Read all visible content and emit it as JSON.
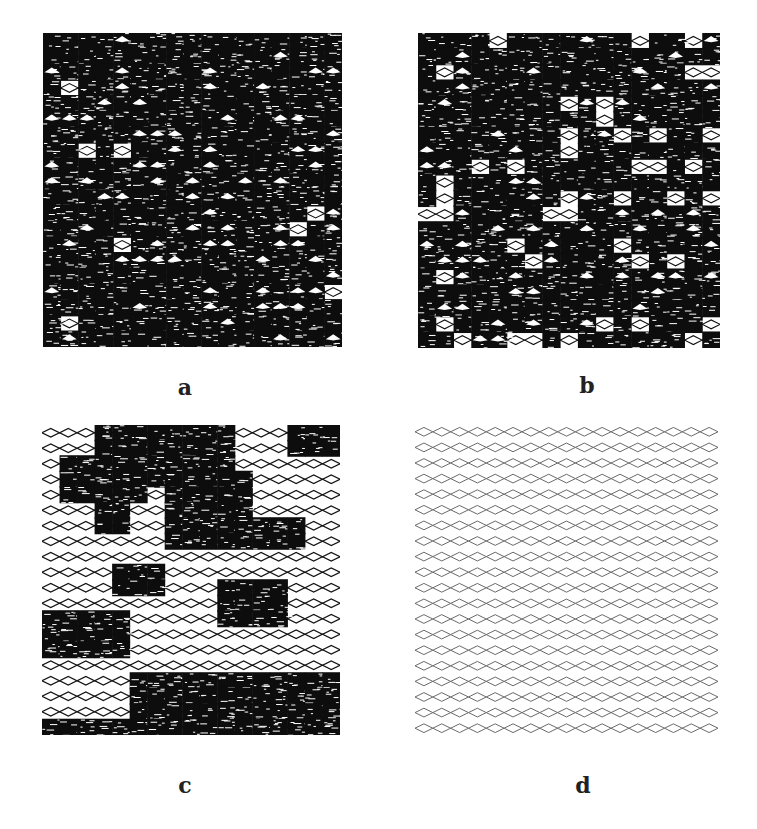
{
  "figure": {
    "panels": [
      {
        "id": "a",
        "label": "a",
        "x": 43,
        "y": 33,
        "width": 299,
        "height": 314,
        "label_x": 165,
        "label_y": 376,
        "rows": 20,
        "cols": 17,
        "density": 0.97,
        "line_color": "#111111",
        "line_width": 1.1,
        "blobs": []
      },
      {
        "id": "b",
        "label": "b",
        "x": 418,
        "y": 33,
        "width": 302,
        "height": 315,
        "label_x": 567,
        "label_y": 374,
        "rows": 20,
        "cols": 17,
        "density": 0.88,
        "line_color": "#111111",
        "line_width": 1.1,
        "blobs": []
      },
      {
        "id": "c",
        "label": "c",
        "x": 42,
        "y": 425,
        "width": 298,
        "height": 310,
        "label_x": 165,
        "label_y": 774,
        "rows": 20,
        "cols": 17,
        "density": 0.0,
        "line_color": "#151515",
        "line_width": 1.3,
        "blobs": [
          {
            "r0": 0,
            "r1": 3,
            "c0": 3,
            "c1": 7
          },
          {
            "r0": 0,
            "r1": 2,
            "c0": 8,
            "c1": 10
          },
          {
            "r0": 0,
            "r1": 1,
            "c0": 14,
            "c1": 16
          },
          {
            "r0": 2,
            "r1": 4,
            "c0": 1,
            "c1": 5
          },
          {
            "r0": 3,
            "r1": 7,
            "c0": 7,
            "c1": 11
          },
          {
            "r0": 5,
            "r1": 6,
            "c0": 3,
            "c1": 4
          },
          {
            "r0": 6,
            "r1": 7,
            "c0": 8,
            "c1": 14
          },
          {
            "r0": 9,
            "r1": 10,
            "c0": 4,
            "c1": 6
          },
          {
            "r0": 10,
            "r1": 12,
            "c0": 10,
            "c1": 13
          },
          {
            "r0": 12,
            "r1": 14,
            "c0": 0,
            "c1": 4
          },
          {
            "r0": 16,
            "r1": 19,
            "c0": 5,
            "c1": 16
          },
          {
            "r0": 19,
            "r1": 19,
            "c0": 0,
            "c1": 16
          }
        ]
      },
      {
        "id": "d",
        "label": "d",
        "x": 415,
        "y": 424,
        "width": 303,
        "height": 312,
        "label_x": 563,
        "label_y": 774,
        "rows": 20,
        "cols": 17,
        "density": 0.0,
        "line_color": "#6a6a6a",
        "line_width": 1.0,
        "blobs": []
      }
    ]
  }
}
